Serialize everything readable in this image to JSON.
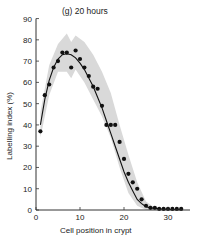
{
  "chart_data": {
    "type": "scatter",
    "title": "(g) 20 hours",
    "xlabel": "Cell position in crypt",
    "ylabel": "Labelling index (%)",
    "xlim": [
      0,
      35
    ],
    "ylim": [
      0,
      90
    ],
    "xticks": [
      0,
      10,
      20,
      30
    ],
    "yticks": [
      0,
      10,
      20,
      30,
      40,
      50,
      60,
      70,
      80,
      90
    ],
    "grid": false,
    "legend": null,
    "series": [
      {
        "name": "observed",
        "kind": "points",
        "x": [
          1,
          2,
          3,
          4,
          5,
          6,
          7,
          8,
          9,
          10,
          11,
          12,
          13,
          14,
          15,
          16,
          17,
          18,
          19,
          20,
          21,
          22,
          23,
          24,
          25,
          26,
          27,
          28,
          29,
          30,
          31,
          32,
          33
        ],
        "y": [
          37,
          54,
          59,
          67,
          70,
          74,
          74,
          67,
          75,
          71,
          67,
          63,
          58,
          57,
          49,
          40,
          40,
          40,
          32,
          24,
          17,
          13,
          10,
          5,
          2,
          1,
          1,
          0.5,
          0.5,
          0.5,
          0.5,
          0.5,
          0.5
        ]
      },
      {
        "name": "fitted curve",
        "kind": "line",
        "x": [
          1,
          2,
          3,
          4,
          5,
          6,
          7,
          8,
          9,
          10,
          11,
          12,
          13,
          14,
          15,
          16,
          17,
          18,
          19,
          20,
          21,
          22,
          23,
          24,
          25,
          26,
          28,
          30,
          33
        ],
        "y": [
          40,
          52,
          61,
          67,
          71,
          73,
          73.5,
          73,
          71.5,
          69,
          66,
          62,
          58,
          53,
          48,
          42,
          36,
          30,
          24,
          18,
          13,
          9,
          5,
          3,
          1.5,
          1,
          0.5,
          0.3,
          0.2
        ]
      },
      {
        "name": "confidence band",
        "kind": "band",
        "x": [
          1,
          3,
          5,
          7,
          8,
          9,
          11,
          13,
          15,
          17,
          19,
          21,
          23,
          25,
          27
        ],
        "upper": [
          46,
          68,
          78,
          83,
          79,
          82,
          79,
          73,
          65,
          55,
          40,
          26,
          13,
          4,
          1
        ],
        "lower": [
          34,
          54,
          65,
          65,
          62,
          66,
          60,
          52,
          44,
          34,
          20,
          8,
          2,
          0,
          0
        ]
      }
    ]
  }
}
